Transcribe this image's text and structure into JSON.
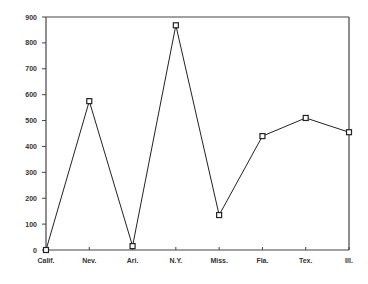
{
  "chart_data": {
    "type": "line",
    "title": "",
    "xlabel": "",
    "ylabel": "",
    "categories": [
      "Calif.",
      "Nev.",
      "Ari.",
      "N.Y.",
      "Miss.",
      "Fla.",
      "Tex.",
      "Ill."
    ],
    "series": [
      {
        "name": "",
        "values": [
          0,
          575,
          15,
          868,
          135,
          440,
          510,
          455
        ]
      }
    ],
    "ylim": [
      0,
      900
    ],
    "yticks": [
      0,
      100,
      200,
      300,
      400,
      500,
      600,
      700,
      800,
      900
    ],
    "grid": false,
    "legend": "none",
    "marker": "square",
    "colors": {
      "line": "#222222",
      "axis": "#444444",
      "label": "#333333"
    }
  }
}
